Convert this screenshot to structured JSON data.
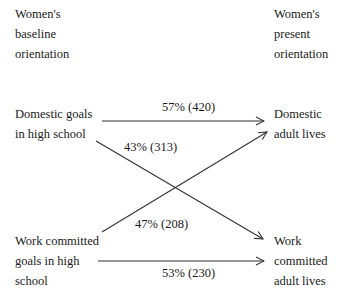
{
  "headers": {
    "left": "Women's\nbaseline\norientation",
    "right": "Women's\npresent\norientation"
  },
  "nodes": {
    "domestic_hs": "Domestic goals\nin high school",
    "work_hs": "Work committed\ngoals in high\nschool",
    "domestic_adult": "Domestic\nadult lives",
    "work_adult": "Work\ncommitted\nadult lives"
  },
  "edges": [
    {
      "from": "Domestic goals in high school",
      "to": "Domestic adult lives",
      "label": "57% (420)",
      "percent": 57,
      "n": 420
    },
    {
      "from": "Domestic goals in high school",
      "to": "Work committed adult lives",
      "label": "43% (313)",
      "percent": 43,
      "n": 313
    },
    {
      "from": "Work committed goals in high school",
      "to": "Domestic adult lives",
      "label": "47% (208)",
      "percent": 47,
      "n": 208
    },
    {
      "from": "Work committed goals in high school",
      "to": "Work committed adult lives",
      "label": "53% (230)",
      "percent": 53,
      "n": 230
    }
  ],
  "colors": {
    "line": "#333333",
    "text": "#1a1a1a"
  }
}
